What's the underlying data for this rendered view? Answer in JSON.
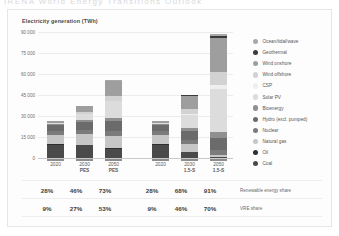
{
  "top_cut_text": "IRENA  World Energy Transitions Outlook",
  "panel": {
    "chart_title": "Electricity generation (TWh)"
  },
  "chart_data": {
    "type": "bar",
    "title": "Electricity generation (TWh)",
    "subtype": "stacked",
    "xlabel": "",
    "ylabel": "Electricity generation (TWh)",
    "ylim": [
      0,
      90000
    ],
    "ytick_labels": [
      "0",
      "15 000",
      "30 000",
      "45 000",
      "60 000",
      "75 000",
      "90 000"
    ],
    "ytick_values": [
      0,
      15000,
      30000,
      45000,
      60000,
      75000,
      90000
    ],
    "grid": true,
    "legend_position": "right",
    "groups": [
      {
        "name": "PES",
        "categories": [
          {
            "year": "2020",
            "scenario": ""
          },
          {
            "year": "2030",
            "scenario": "PES"
          },
          {
            "year": "2050",
            "scenario": "PES"
          }
        ]
      },
      {
        "name": "1.5-S",
        "categories": [
          {
            "year": "2020",
            "scenario": ""
          },
          {
            "year": "2030",
            "scenario": "1.5-S"
          },
          {
            "year": "2050",
            "scenario": "1.5-S"
          }
        ]
      }
    ],
    "x": [
      "2020",
      "2030 PES",
      "2050 PES",
      "2020",
      "2030 1.5-S",
      "2050 1.5-S"
    ],
    "series": [
      {
        "name": "Coal",
        "color": "#4a4a4a",
        "values": [
          9500,
          9000,
          6500,
          9500,
          4200,
          600
        ]
      },
      {
        "name": "Oil",
        "color": "#2e2e2e",
        "values": [
          750,
          500,
          400,
          750,
          300,
          100
        ]
      },
      {
        "name": "Natural gas",
        "color": "#c6c6c6",
        "values": [
          6200,
          7600,
          8500,
          6200,
          5200,
          1600
        ]
      },
      {
        "name": "Nuclear",
        "color": "#7b7b7b",
        "values": [
          2700,
          3000,
          3600,
          2700,
          3100,
          3600
        ]
      },
      {
        "name": "Hydro (excl. pumped)",
        "color": "#6b6b6b",
        "values": [
          4300,
          5600,
          7200,
          4300,
          6200,
          8200
        ]
      },
      {
        "name": "Bioenergy",
        "color": "#8f8f8f",
        "values": [
          700,
          1300,
          2200,
          700,
          2200,
          4400
        ]
      },
      {
        "name": "Solar PV",
        "color": "#dcdcdc",
        "values": [
          850,
          4500,
          12000,
          850,
          9800,
          30500
        ]
      },
      {
        "name": "CSP",
        "color": "#efefef",
        "values": [
          15,
          150,
          700,
          15,
          800,
          3500
        ]
      },
      {
        "name": "Wind offshore",
        "color": "#d2d2d2",
        "values": [
          130,
          1100,
          3200,
          130,
          3000,
          9000
        ]
      },
      {
        "name": "Wind onshore",
        "color": "#9e9e9e",
        "values": [
          1450,
          4400,
          10500,
          1450,
          9500,
          24500
        ]
      },
      {
        "name": "Geothermal",
        "color": "#3a3a3a",
        "values": [
          95,
          200,
          500,
          95,
          450,
          1400
        ]
      },
      {
        "name": "Ocean/tidal/wave",
        "color": "#a8a8a8",
        "values": [
          2,
          20,
          150,
          2,
          150,
          900
        ]
      }
    ]
  },
  "legend": {
    "items": [
      {
        "label": "Ocean/tidal/wave",
        "color": "#a8a8a8"
      },
      {
        "label": "Geothermal",
        "color": "#3a3a3a"
      },
      {
        "label": "Wind onshore",
        "color": "#9e9e9e"
      },
      {
        "label": "Wind offshore",
        "color": "#d2d2d2"
      },
      {
        "label": "CSP",
        "color": "#efefef"
      },
      {
        "label": "Solar PV",
        "color": "#dcdcdc"
      },
      {
        "label": "Bioenergy",
        "color": "#8f8f8f"
      },
      {
        "label": "Hydro (excl. pumped)",
        "color": "#6b6b6b"
      },
      {
        "label": "Nuclear",
        "color": "#7b7b7b"
      },
      {
        "label": "Natural gas",
        "color": "#c6c6c6"
      },
      {
        "label": "Oil",
        "color": "#2e2e2e"
      },
      {
        "label": "Coal",
        "color": "#4a4a4a"
      }
    ]
  },
  "xaxis": {
    "labels": [
      {
        "year": "2020",
        "scenario": ""
      },
      {
        "year": "2030",
        "scenario": "PES"
      },
      {
        "year": "2050",
        "scenario": "PES"
      },
      {
        "year": "2020",
        "scenario": ""
      },
      {
        "year": "2030",
        "scenario": "1.5-S"
      },
      {
        "year": "2050",
        "scenario": "1.5-S"
      }
    ]
  },
  "table": {
    "rows": [
      {
        "label": "Renewable energy share",
        "values": [
          "28%",
          "46%",
          "73%",
          "28%",
          "68%",
          "91%"
        ]
      },
      {
        "label": "VRE share",
        "values": [
          "9%",
          "27%",
          "53%",
          "9%",
          "46%",
          "70%"
        ]
      }
    ]
  }
}
